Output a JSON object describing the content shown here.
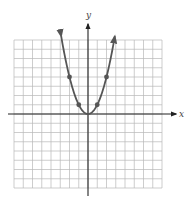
{
  "chart_data": {
    "type": "line",
    "title": "",
    "function": "y = x^2",
    "xlabel": "x",
    "ylabel": "y",
    "xlim": [
      -8,
      8
    ],
    "ylim": [
      -8,
      8
    ],
    "grid": true,
    "grid_step": 1,
    "legend": null,
    "series": [
      {
        "name": "y = x^2",
        "x": [
          -3,
          -2,
          -1,
          0,
          1,
          2,
          3
        ],
        "y": [
          9,
          4,
          1,
          0,
          1,
          4,
          9
        ],
        "arrows_at_ends": true
      }
    ],
    "marked_points": [
      {
        "x": -2,
        "y": 4
      },
      {
        "x": -1,
        "y": 1
      },
      {
        "x": 1,
        "y": 1
      },
      {
        "x": 2,
        "y": 4
      }
    ],
    "colors": {
      "curve": "#555555",
      "grid": "#b8b8b8",
      "axis": "#222222"
    }
  },
  "labels": {
    "x_axis": "x",
    "y_axis": "y"
  }
}
